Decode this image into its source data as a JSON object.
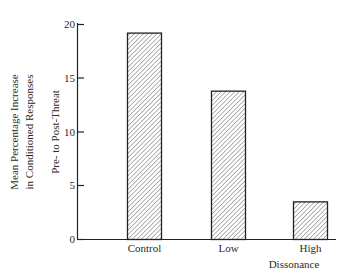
{
  "chart_data": {
    "type": "bar",
    "title": "",
    "categories": [
      "Control",
      "Low",
      "High"
    ],
    "values": [
      19.2,
      13.8,
      3.5
    ],
    "xlabel": "Dissonance",
    "ylabel": [
      "Mean Percentage Increase",
      "in Conditioned Responses",
      "Pre- to Post-Threat"
    ],
    "ylim": [
      0,
      20
    ],
    "yticks": [
      0,
      5,
      10,
      15,
      20
    ],
    "grid": false,
    "legend": null,
    "bar_style": "diagonal hatch"
  },
  "axis": {
    "ytick_labels": [
      "0",
      "5",
      "10",
      "15",
      "20"
    ],
    "xlabel": "Dissonance",
    "ylabel_line1": "Mean Percentage Increase",
    "ylabel_line2": "in Conditioned Responses",
    "ylabel_line3": "Pre- to Post-Threat"
  },
  "colors": {
    "ink": "#2a2a2a",
    "background": "#ffffff"
  }
}
